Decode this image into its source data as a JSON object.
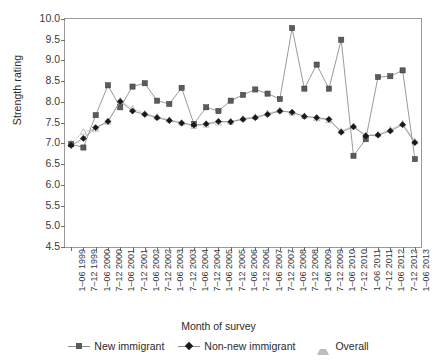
{
  "axes": {
    "ylabel": "Strength rating",
    "xlabel": "Month of survey",
    "yticks": [
      "10.0",
      "9.5",
      "9.0",
      "8.5",
      "8.0",
      "7.5",
      "7.0",
      "6.5",
      "6.0",
      "5.5",
      "5.0",
      "4.5"
    ]
  },
  "legend": {
    "items": [
      {
        "label": "New immigrant",
        "marker": "square",
        "color": "#5b5b5b"
      },
      {
        "label": "Non-new immigrant",
        "marker": "diamond",
        "color": "#1a1a1a"
      },
      {
        "label": "Overall",
        "marker": "triangle",
        "color": "#bdbdbd"
      }
    ]
  },
  "chart_data": {
    "type": "line",
    "title": "",
    "xlabel": "Month of survey",
    "ylabel": "Strength rating",
    "ylim": [
      4.5,
      10.0
    ],
    "ytick_step": 0.5,
    "grid": false,
    "legend_position": "bottom",
    "categories": [
      "1–06 1999",
      "7–12 1999",
      "1–06 2000",
      "7–12 2000",
      "1–06 2001",
      "7–12 2001",
      "1–06 2002",
      "7–12 2002",
      "1–06 2003",
      "7–12 2003",
      "1–06 2004",
      "7–12 2004",
      "1–06 2005",
      "7–12 2005",
      "1–06 2006",
      "7–12 2006",
      "1–06 2007",
      "7–12 2007",
      "1–06 2008",
      "7–12 2008",
      "1–06 2009",
      "7–12 2009",
      "1–06 2010",
      "7–12 2010",
      "1–06 2011",
      "7–12 2011",
      "1–06 2012",
      "7–12 2012",
      "1–06 2013"
    ],
    "series": [
      {
        "name": "New immigrant",
        "marker": "square",
        "color": "#5b5b5b",
        "values": [
          6.98,
          6.9,
          7.68,
          8.4,
          7.87,
          8.37,
          8.45,
          8.03,
          7.95,
          8.34,
          7.47,
          7.87,
          7.78,
          8.03,
          8.17,
          8.3,
          8.2,
          8.07,
          9.78,
          8.32,
          8.9,
          8.32,
          9.5,
          6.7,
          7.1,
          8.6,
          8.62,
          8.76,
          6.62
        ]
      },
      {
        "name": "Non-new immigrant",
        "marker": "diamond",
        "color": "#1a1a1a",
        "values": [
          6.95,
          7.12,
          7.38,
          7.53,
          8.01,
          7.78,
          7.7,
          7.62,
          7.55,
          7.49,
          7.44,
          7.47,
          7.53,
          7.52,
          7.58,
          7.62,
          7.7,
          7.78,
          7.75,
          7.65,
          7.62,
          7.58,
          7.27,
          7.4,
          7.18,
          7.2,
          7.3,
          7.45,
          7.02
        ]
      },
      {
        "name": "Overall",
        "marker": "triangle",
        "color": "#bdbdbd",
        "values": [
          7.0,
          7.28,
          7.35,
          7.52,
          8.03,
          7.84,
          7.72,
          7.64,
          7.57,
          7.5,
          7.42,
          7.45,
          7.5,
          7.52,
          7.6,
          7.64,
          7.72,
          7.8,
          7.74,
          7.66,
          7.6,
          7.56,
          7.3,
          7.42,
          7.2,
          7.22,
          7.33,
          7.48,
          7.05
        ]
      }
    ]
  }
}
